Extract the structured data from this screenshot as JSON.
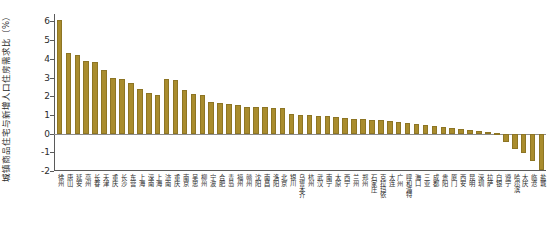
{
  "chart_data": {
    "type": "bar",
    "title": "",
    "subtitle": "",
    "xlabel": "",
    "ylabel": "城镇商品住宅与新增人口住房需求比（%）",
    "ylim": [
      -2,
      6.4
    ],
    "yticks": [
      -2,
      -1,
      0,
      1,
      2,
      3,
      4,
      5,
      6
    ],
    "ytick_labels": [
      "-2",
      "-1",
      "0",
      "1",
      "2",
      "3",
      "4",
      "5",
      "6"
    ],
    "grid": false,
    "legend": null,
    "bar_color": "#a98c2d",
    "axis_color": "#5a5a5a",
    "categories": [
      "徐州",
      "唐山",
      "延安",
      "亳州",
      "长春",
      "天津",
      "重庆",
      "长沙",
      "东营",
      "上海",
      "深南",
      "上海",
      "济南",
      "重庆",
      "南京",
      "吴忠",
      "柳州",
      "宁波",
      "合肥",
      "青岛",
      "福州",
      "赣州",
      "沈阳",
      "南昌",
      "洛阳",
      "北京",
      "银川",
      "乌鲁木齐",
      "杭州",
      "武汉",
      "南宁",
      "太原",
      "西宁",
      "兰州",
      "郑州",
      "石家庄",
      "克拉玛依",
      "大连",
      "广州",
      "呼和浩特",
      "海口",
      "三亚",
      "成都",
      "贵阳",
      "厦门",
      "西安",
      "昆明",
      "深圳",
      "拉萨",
      "白银",
      "遵宁",
      "哈尔滨",
      "大庆",
      "临沧",
      "盐城"
    ],
    "values": [
      6.1,
      4.3,
      4.2,
      3.9,
      3.85,
      3.4,
      3.0,
      2.9,
      2.7,
      2.4,
      2.15,
      2.05,
      2.9,
      2.85,
      2.35,
      2.1,
      2.05,
      1.7,
      1.62,
      1.6,
      1.55,
      1.45,
      1.42,
      1.4,
      1.38,
      1.35,
      1.05,
      1.0,
      0.98,
      0.95,
      0.93,
      0.9,
      0.85,
      0.8,
      0.78,
      0.75,
      0.72,
      0.68,
      0.62,
      0.58,
      0.52,
      0.48,
      0.42,
      0.36,
      0.3,
      0.25,
      0.2,
      0.15,
      0.1,
      0.05,
      -0.45,
      -0.85,
      -1.05,
      -1.45,
      -1.95
    ]
  }
}
